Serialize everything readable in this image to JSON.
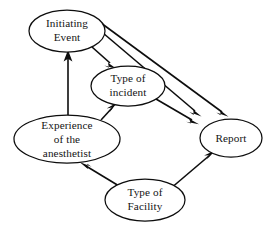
{
  "diagram": {
    "type": "directed-graph",
    "background_color": "#ffffff",
    "line_color": "#0d0d0d",
    "text_color": "#141414",
    "nodes": [
      {
        "id": "initiating-event",
        "label_lines": [
          "Initiating",
          "Event"
        ],
        "line1": "Initiating",
        "line2": "Event",
        "cx": 67,
        "cy": 31,
        "rx": 38,
        "ry": 21
      },
      {
        "id": "type-of-incident",
        "label_lines": [
          "Type of",
          "incident"
        ],
        "line1": "Type of",
        "line2": "incident",
        "cx": 128,
        "cy": 86,
        "rx": 37,
        "ry": 20
      },
      {
        "id": "experience-of-the-anesthetist",
        "label_lines": [
          "Experience",
          "of the",
          "anesthetist"
        ],
        "line1": "Experience",
        "line2": "of the",
        "line3": "anesthetist",
        "cx": 67,
        "cy": 139,
        "rx": 53,
        "ry": 24
      },
      {
        "id": "report",
        "label_lines": [
          "Report"
        ],
        "line1": "Report",
        "cx": 231,
        "cy": 138,
        "rx": 31,
        "ry": 19
      },
      {
        "id": "type-of-facility",
        "label_lines": [
          "Type of",
          "Facility"
        ],
        "line1": "Type of",
        "line2": "Facility",
        "cx": 145,
        "cy": 200,
        "rx": 40,
        "ry": 21
      }
    ],
    "edges": [
      {
        "id": "edge-experience-to-initiating-event",
        "from": "experience-of-the-anesthetist",
        "to": "initiating-event",
        "label": "Experience of the anesthetist to Initiating Event"
      },
      {
        "id": "edge-initiating-event-to-type-of-incident",
        "from": "initiating-event",
        "to": "type-of-incident",
        "label": "Initiating Event to Type of incident"
      },
      {
        "id": "edge-initiating-event-to-report",
        "from": "initiating-event",
        "to": "report",
        "label": "Initiating Event to Report"
      },
      {
        "id": "edge-initiating-event-to-report-second",
        "from": "initiating-event",
        "to": "report",
        "label": "Initiating Event to Report (second path)"
      },
      {
        "id": "edge-experience-to-type-of-incident",
        "from": "experience-of-the-anesthetist",
        "to": "type-of-incident",
        "label": "Experience of the anesthetist to Type of incident"
      },
      {
        "id": "edge-type-of-incident-to-report",
        "from": "type-of-incident",
        "to": "report",
        "label": "Type of incident to Report"
      },
      {
        "id": "edge-type-of-facility-to-experience",
        "from": "type-of-facility",
        "to": "experience-of-the-anesthetist",
        "label": "Type of Facility to Experience of the anesthetist"
      },
      {
        "id": "edge-type-of-facility-to-report",
        "from": "type-of-facility",
        "to": "report",
        "label": "Type of Facility to Report"
      }
    ]
  }
}
